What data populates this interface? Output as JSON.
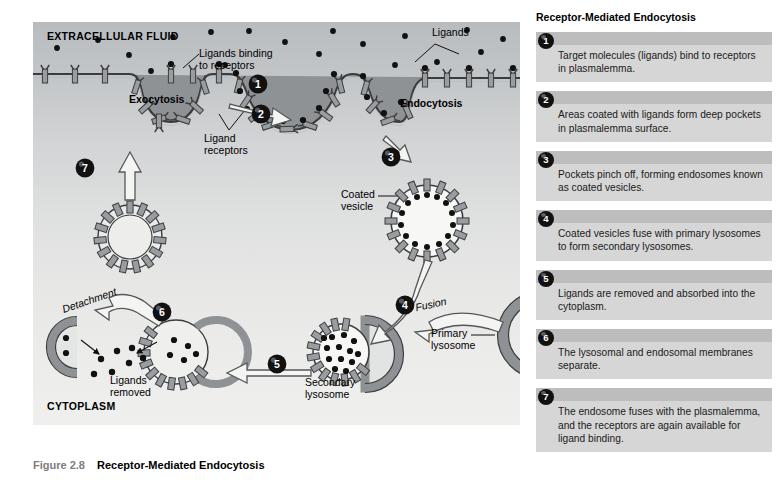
{
  "figure": {
    "number": "Figure 2.8",
    "title": "Receptor-Mediated Endocytosis"
  },
  "diagram": {
    "region_labels": {
      "extracellular": "EXTRACELLULAR FLUID",
      "cytoplasm": "CYTOPLASM"
    },
    "labels": {
      "exocytosis": "Exocytosis",
      "endocytosis": "Endocytosis",
      "ligands_binding_line1": "Ligands binding",
      "ligands_binding_line2": "to receptors",
      "ligand_receptors_line1": "Ligand",
      "ligand_receptors_line2": "receptors",
      "ligands": "Ligands",
      "coated_vesicle_line1": "Coated",
      "coated_vesicle_line2": "vesicle",
      "fusion": "Fusion",
      "primary_lysosome_line1": "Primary",
      "primary_lysosome_line2": "lysosome",
      "secondary_lysosome_line1": "Secondary",
      "secondary_lysosome_line2": "lysosome",
      "ligands_removed_line1": "Ligands",
      "ligands_removed_line2": "removed",
      "detachment": "Detachment"
    },
    "step_markers": [
      "1",
      "2",
      "3",
      "4",
      "5",
      "6",
      "7"
    ],
    "colors": {
      "membrane_fill": "#8f9295",
      "membrane_stroke": "#3a3c3e",
      "ligand_dot": "#111111",
      "arrow_fill": "#f4f4f2",
      "arrow_stroke": "#555759",
      "extracellular_top": "#b9bcbe",
      "cytoplasm_bottom": "#efefee"
    }
  },
  "steps_panel": {
    "title": "Receptor-Mediated Endocytosis",
    "steps": [
      {
        "number": "1",
        "text": "Target molecules (ligands) bind to receptors in plasmalemma."
      },
      {
        "number": "2",
        "text": "Areas coated with ligands form deep pockets in plasmalemma surface."
      },
      {
        "number": "3",
        "text": "Pockets pinch off, forming endosomes known as coated vesicles."
      },
      {
        "number": "4",
        "text": "Coated vesicles fuse with primary lysosomes to form secondary lysosomes."
      },
      {
        "number": "5",
        "text": "Ligands are removed and absorbed into the cytoplasm."
      },
      {
        "number": "6",
        "text": "The lysosomal and endosomal membranes separate."
      },
      {
        "number": "7",
        "text": "The endosome fuses with the plasmalemma, and the receptors are again available for ligand binding."
      }
    ]
  }
}
